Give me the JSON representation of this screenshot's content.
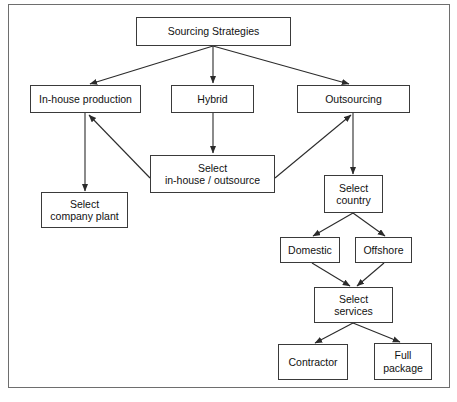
{
  "figure": {
    "type": "flowchart",
    "frame_color": "#6e6e6e",
    "node_border_color": "#3a3a3a",
    "connector_color": "#2b2b2b",
    "background": "#ffffff",
    "caption_fragment": ""
  },
  "nodes": {
    "sourcing_strategies": {
      "label": "Sourcing Strategies"
    },
    "in_house_production": {
      "label": "In-house production"
    },
    "hybrid": {
      "label": "Hybrid"
    },
    "outsourcing": {
      "label": "Outsourcing"
    },
    "select_in_house_outsource": {
      "label": "Select\nin-house / outsource"
    },
    "select_company_plant": {
      "label": "Select\ncompany plant"
    },
    "select_country": {
      "label": "Select\ncountry"
    },
    "domestic": {
      "label": "Domestic"
    },
    "offshore": {
      "label": "Offshore"
    },
    "select_services": {
      "label": "Select\nservices"
    },
    "contractor": {
      "label": "Contractor"
    },
    "full_package": {
      "label": "Full\npackage"
    }
  },
  "edges": [
    {
      "from": "sourcing_strategies",
      "to": "in_house_production",
      "arrow": "to"
    },
    {
      "from": "sourcing_strategies",
      "to": "hybrid",
      "arrow": "to"
    },
    {
      "from": "sourcing_strategies",
      "to": "outsourcing",
      "arrow": "to"
    },
    {
      "from": "in_house_production",
      "to": "select_company_plant",
      "arrow": "to"
    },
    {
      "from": "hybrid",
      "to": "select_in_house_outsource",
      "arrow": "to"
    },
    {
      "from": "select_in_house_outsource",
      "to": "in_house_production",
      "arrow": "to"
    },
    {
      "from": "select_in_house_outsource",
      "to": "outsourcing",
      "arrow": "to"
    },
    {
      "from": "outsourcing",
      "to": "select_country",
      "arrow": "to"
    },
    {
      "from": "select_country",
      "to": "domestic",
      "arrow": "to"
    },
    {
      "from": "select_country",
      "to": "offshore",
      "arrow": "to"
    },
    {
      "from": "domestic",
      "to": "select_services",
      "arrow": "to"
    },
    {
      "from": "offshore",
      "to": "select_services",
      "arrow": "to"
    },
    {
      "from": "select_services",
      "to": "contractor",
      "arrow": "to"
    },
    {
      "from": "select_services",
      "to": "full_package",
      "arrow": "to"
    }
  ]
}
